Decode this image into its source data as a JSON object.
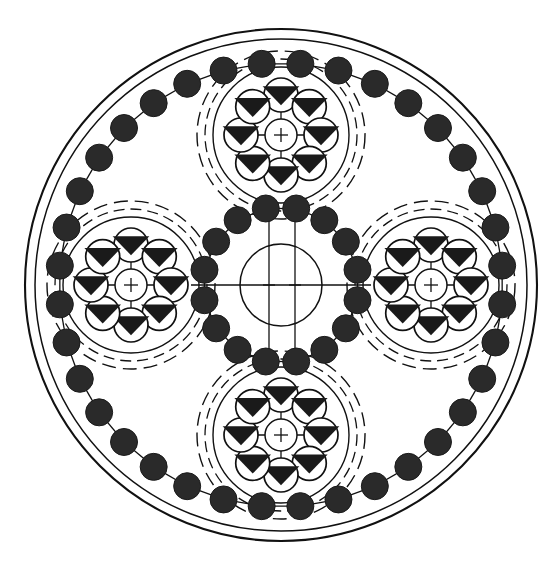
{
  "figure": {
    "kind": "technical-line-drawing",
    "colors": {
      "line": "#111111",
      "bead_fill": "#2a2a2a",
      "triangle_fill": "#1a1a1a",
      "background": "#ffffff"
    },
    "canvas": {
      "width": 556,
      "height": 567
    }
  },
  "geometry": {
    "center": {
      "x": 281,
      "y": 285
    },
    "outer_boundary_radius": 256,
    "outer_inner_radius": 246,
    "outer_bead_path_radius": 222,
    "outer_bead_count": 36,
    "outer_bead_radius": 13.5,
    "hub": {
      "label": "central-hub",
      "cx": 281,
      "cy": 285,
      "bead_path_radius": 78,
      "bead_count": 16,
      "bead_radius": 13.5,
      "core_circle_radius": 41,
      "centerline_h_half_length": 90,
      "centerline_v_half_length": 66,
      "centerline_v_offsets": [
        -12,
        14
      ]
    },
    "satellite": {
      "label": "planet-assembly",
      "orbit_radius": 150,
      "dash_outer_radius": 84,
      "dash_inner_radius": 76,
      "solid_radius": 68,
      "triangle_ring_radius": 40,
      "triangle_circle_radius": 17,
      "triangle_count": 8,
      "core_circle_radius": 16,
      "cross_arm_length": 33,
      "angles_deg": [
        270,
        180,
        0,
        90
      ]
    }
  },
  "chart_data": {
    "type": "scatter",
    "xlabel": "",
    "ylabel": "",
    "grid": false,
    "legend": "none",
    "series": [
      {
        "name": "outer-bead-ring",
        "description": "Chain of 36 filled beads on a circular path of radius 222 px about the figure center",
        "count": 36,
        "radius_px": 222,
        "marker_radius_px": 13.5
      },
      {
        "name": "hub-bead-ring",
        "description": "Chain of 16 filled beads on a circular path of radius 78 px about the figure center",
        "count": 16,
        "radius_px": 78,
        "marker_radius_px": 13.5
      },
      {
        "name": "satellite-assemblies",
        "description": "Four identical planet assemblies at 150 px from center, at 0, 90, 180 and 270 degrees",
        "count": 4,
        "radius_px": 150,
        "triangles_each": 8
      }
    ]
  },
  "elements": {
    "outer_boundary": "outer-boundary-circle",
    "outer_inner": "outer-inner-circle",
    "outer_chain": "outer-bead-chain",
    "hub_chain": "hub-bead-chain",
    "hub_core": "hub-core-circle",
    "hub_centerlines": "hub-centerlines",
    "satellites": [
      {
        "name": "satellite-top",
        "angle_deg": 270
      },
      {
        "name": "satellite-left",
        "angle_deg": 180
      },
      {
        "name": "satellite-right",
        "angle_deg": 0
      },
      {
        "name": "satellite-bottom",
        "angle_deg": 90
      }
    ]
  }
}
